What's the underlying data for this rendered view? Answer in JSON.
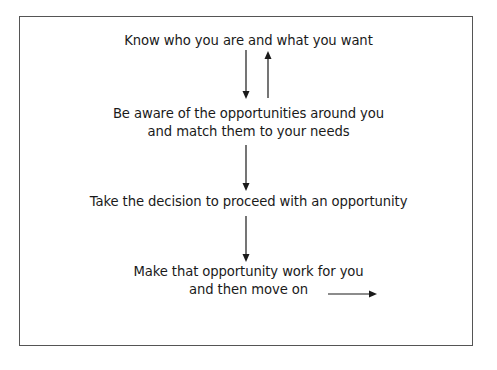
{
  "diagram": {
    "steps": [
      {
        "lines": [
          "Know who you are and what you want"
        ]
      },
      {
        "lines": [
          "Be aware of the opportunities around you",
          "and match them to your needs"
        ]
      },
      {
        "lines": [
          "Take the decision to proceed with an opportunity"
        ]
      },
      {
        "lines": [
          "Make that opportunity work for you",
          "and then move on"
        ]
      }
    ],
    "connections": [
      {
        "from": 0,
        "to": 1,
        "direction": "down"
      },
      {
        "from": 1,
        "to": 0,
        "direction": "up"
      },
      {
        "from": 1,
        "to": 2,
        "direction": "down"
      },
      {
        "from": 2,
        "to": 3,
        "direction": "down"
      },
      {
        "from": 3,
        "to": "next",
        "direction": "right"
      }
    ],
    "colors": {
      "stroke": "#1a1a1a",
      "frame": "#555555",
      "background": "#ffffff"
    }
  }
}
